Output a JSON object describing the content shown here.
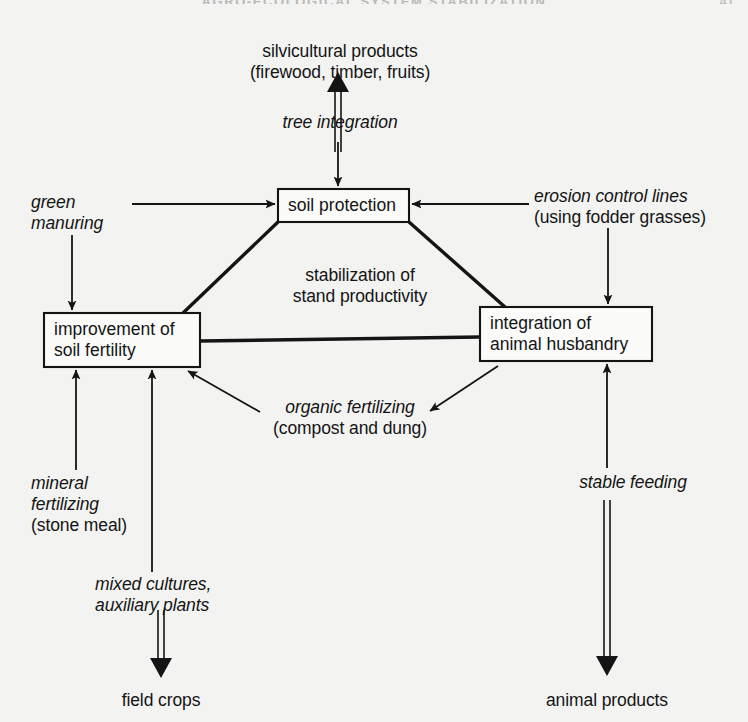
{
  "header": {
    "running_head": "AGRO-ECOLOGICAL SYSTEM STABILIZATION",
    "page_number": "41"
  },
  "diagram": {
    "boxes": [
      {
        "id": "soil-protection",
        "label_line1": "soil protection",
        "label_line2": ""
      },
      {
        "id": "soil-fertility",
        "label_line1": "improvement of",
        "label_line2": "soil fertility"
      },
      {
        "id": "animal-husbandry",
        "label_line1": "integration of",
        "label_line2": "animal husbandry"
      }
    ],
    "labels": {
      "silvicultural_products_l1": "silvicultural products",
      "silvicultural_products_l2": "(firewood, timber, fruits)",
      "tree_integration": "tree integration",
      "green_manuring_l1": "green",
      "green_manuring_l2": "manuring",
      "erosion_control_l1": "erosion control lines",
      "erosion_control_l2": "(using fodder grasses)",
      "stabilization_l1": "stabilization of",
      "stabilization_l2": "stand productivity",
      "organic_fertilizing_l1": "organic fertilizing",
      "organic_fertilizing_l2": "(compost and dung)",
      "mineral_fertilizing_l1": "mineral",
      "mineral_fertilizing_l2": "fertilizing",
      "mineral_fertilizing_l3": "(stone meal)",
      "mixed_cultures_l1": "mixed cultures,",
      "mixed_cultures_l2": "auxiliary plants",
      "field_crops": "field crops",
      "stable_feeding": "stable feeding",
      "animal_products": "animal products"
    },
    "colors": {
      "background": "#f3f3f1",
      "ink": "#141414",
      "box_fill": "#fbfbfa"
    }
  }
}
